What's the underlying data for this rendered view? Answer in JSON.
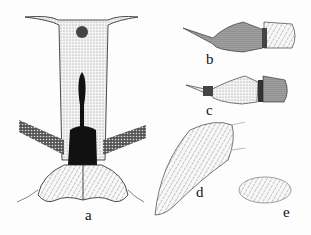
{
  "figure": {
    "labels": {
      "a": "a",
      "b": "b",
      "c": "c",
      "d": "d",
      "e": "e"
    },
    "colors": {
      "ink": "#111111",
      "stipple": "#9a9a9a",
      "paper": "#fdfdfd"
    }
  }
}
